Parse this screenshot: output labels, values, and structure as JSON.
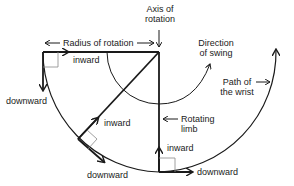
{
  "diagram": {
    "labels": {
      "axis_of_rotation_line1": "Axis of",
      "axis_of_rotation_line2": "rotation",
      "radius_of_rotation": "Radius of rotation",
      "direction_of_swing_line1": "Direction",
      "direction_of_swing_line2": "of swing",
      "path_of_wrist_line1": "Path of",
      "path_of_wrist_line2": "the wrist",
      "rotating_limb_line1": "Rotating",
      "rotating_limb_line2": "limb",
      "inward_top": "inward",
      "downward_left": "downward",
      "inward_middle": "inward",
      "downward_middle": "downward",
      "inward_bottom": "inward",
      "downward_bottom": "downward"
    },
    "colors": {
      "stroke": "#1a1a1a",
      "right_angle_marker": "#888888"
    }
  }
}
